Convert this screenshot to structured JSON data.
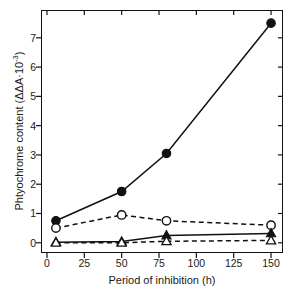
{
  "chart_data": {
    "type": "line",
    "title": "",
    "xlabel": "Period of inhibition (h)",
    "ylabel": "Phtyochrome content (ΔΔA·10⁻³)",
    "ylabel_base": "Phtyochrome content (ΔΔA·10",
    "ylabel_exp": "-3",
    "ylabel_tail": ")",
    "xlim": [
      -4,
      158
    ],
    "ylim": [
      -0.35,
      7.95
    ],
    "grid": false,
    "legend": "none",
    "xticks": [
      0,
      25,
      50,
      75,
      100,
      125,
      150
    ],
    "xtick_labels": [
      "0",
      "25",
      "50",
      "75",
      "100",
      "125",
      "150"
    ],
    "yticks": [
      0,
      1,
      2,
      3,
      4,
      5,
      6,
      7
    ],
    "ytick_labels": [
      "0",
      "1",
      "2",
      "3",
      "4",
      "5",
      "6",
      "7"
    ],
    "x": [
      6,
      50,
      80,
      150
    ],
    "series": [
      {
        "name": "filled-circle-solid",
        "marker": "filled-circle",
        "line": "solid",
        "color": "#111111",
        "values": [
          0.75,
          1.75,
          3.05,
          7.5
        ]
      },
      {
        "name": "open-circle-dashed",
        "marker": "open-circle",
        "line": "dashed",
        "color": "#111111",
        "values": [
          0.5,
          0.95,
          0.75,
          0.6
        ]
      },
      {
        "name": "filled-triangle-solid",
        "marker": "filled-triangle",
        "line": "solid",
        "color": "#111111",
        "values": [
          0.02,
          0.04,
          0.25,
          0.32
        ]
      },
      {
        "name": "open-triangle-dashed",
        "marker": "open-triangle",
        "line": "dashed",
        "color": "#111111",
        "values": [
          0.0,
          0.0,
          0.05,
          0.08
        ]
      }
    ]
  }
}
